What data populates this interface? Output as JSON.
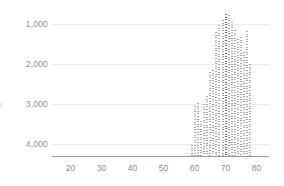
{
  "chart_data": {
    "type": "bar",
    "title": "",
    "xlabel": "",
    "ylabel": "",
    "xlim": [
      14,
      84
    ],
    "ylim": [
      4300,
      600
    ],
    "y_axis_inverted": true,
    "grid": true,
    "legend": "none",
    "x_ticks": [
      "20",
      "30",
      "40",
      "50",
      "60",
      "70",
      "80"
    ],
    "x_tick_values": [
      20,
      30,
      40,
      50,
      60,
      70,
      80
    ],
    "y_ticks": [
      "1,000",
      "2,000",
      "3,000",
      "4,000"
    ],
    "y_tick_values": [
      1000,
      2000,
      3000,
      4000
    ],
    "bar_color": "#9c9c9c",
    "grid_color": "#eceaea",
    "axis_color": "#9a9a9a",
    "tick_label_color": "#8e8e8e",
    "x": [
      59,
      60,
      61,
      62,
      63,
      64,
      65,
      66,
      67,
      68,
      69,
      70,
      71,
      72,
      73,
      74,
      75,
      76,
      77,
      78
    ],
    "values": [
      4020,
      3050,
      2980,
      3420,
      3000,
      2800,
      2200,
      2140,
      1200,
      1020,
      900,
      760,
      780,
      940,
      1140,
      1380,
      1320,
      1700,
      1180,
      2000
    ],
    "highlight_x": 70,
    "annotation_edge_glyph": "3"
  }
}
